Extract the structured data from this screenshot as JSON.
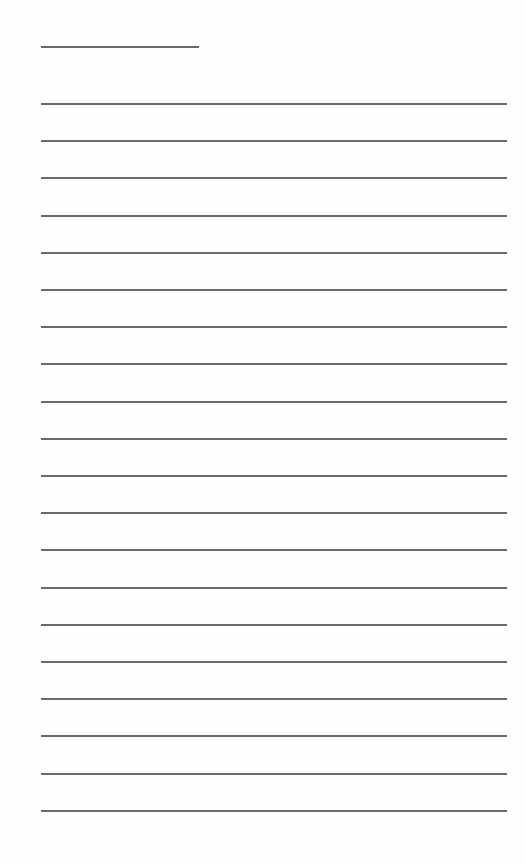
{
  "page": {
    "type": "lined-writing-sheet",
    "background_color": "#fefefe",
    "rule_color": "#6a6a6a",
    "header_line": {
      "x": 41,
      "y": 46,
      "width": 158
    },
    "ruled_lines": {
      "count": 20,
      "x": 41,
      "width": 466,
      "first_y": 103,
      "spacing": 37.2
    },
    "text_content": ""
  }
}
